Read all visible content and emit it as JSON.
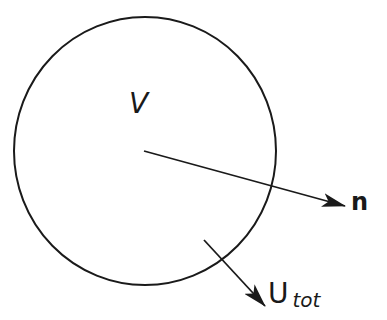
{
  "diagram": {
    "region": {
      "label": "V",
      "shape": "circle",
      "center": [
        145,
        151
      ],
      "radius_x": 131,
      "radius_y": 134
    },
    "vectors": [
      {
        "name": "normal",
        "label": "n",
        "from": [
          144,
          151
        ],
        "to": [
          345,
          206
        ]
      },
      {
        "name": "total-velocity",
        "label": "U",
        "subscript": "tot",
        "from": [
          204,
          240
        ],
        "to": [
          265,
          306
        ]
      }
    ],
    "colors": {
      "stroke": "#1a1a1a",
      "background": "#ffffff"
    }
  }
}
